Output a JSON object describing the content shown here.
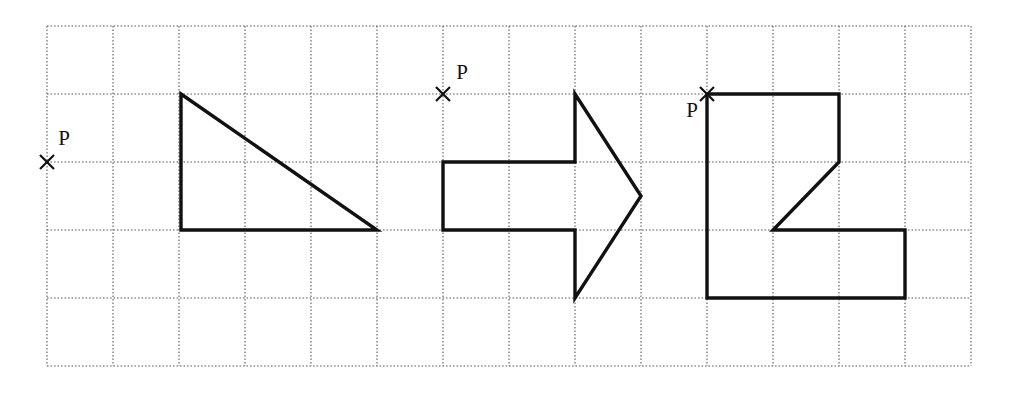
{
  "figure": {
    "canvas": {
      "width": 1013,
      "height": 394
    },
    "grid": {
      "origin_x": 47,
      "origin_y": 26,
      "cell_width": 66,
      "cell_height": 68,
      "columns": 14,
      "rows": 5,
      "line_color": "#5a5a5a",
      "line_style": "dotted"
    },
    "shape_color": "#111111",
    "shapes": [
      {
        "name": "right-triangle",
        "type": "polygon",
        "closed": true,
        "grid_vertices": [
          [
            2,
            1
          ],
          [
            5,
            2
          ],
          [
            2,
            2
          ]
        ],
        "points": "181,94 377,230 181,230"
      },
      {
        "name": "arrow-pentagon",
        "type": "polygon",
        "closed": true,
        "grid_vertices": [
          [
            8,
            1
          ],
          [
            9,
            2.5
          ],
          [
            8,
            4
          ],
          [
            8,
            3
          ],
          [
            6,
            3
          ],
          [
            6,
            2
          ],
          [
            8,
            2
          ]
        ],
        "points": "575,94 641,196 575,298 575,230 443,230 443,162 575,162"
      },
      {
        "name": "z-block-polygon",
        "type": "polygon",
        "closed": true,
        "grid_vertices": [
          [
            10,
            1
          ],
          [
            12,
            1
          ],
          [
            12,
            2
          ],
          [
            11,
            3
          ],
          [
            13,
            3
          ],
          [
            13,
            4
          ],
          [
            10,
            4
          ]
        ],
        "points": "707,94 839,94 839,162 773,230 905,230 905,298 707,298"
      }
    ],
    "points": [
      {
        "name": "point-p-1",
        "label": "P",
        "mark": "x",
        "x": 47,
        "y": 162,
        "label_x": 64,
        "label_y": 145,
        "label_anchor": "middle"
      },
      {
        "name": "point-p-2",
        "label": "P",
        "mark": "x",
        "x": 443,
        "y": 94,
        "label_x": 462,
        "label_y": 79,
        "label_anchor": "middle"
      },
      {
        "name": "point-p-3",
        "label": "P",
        "mark": "x",
        "x": 707,
        "y": 94,
        "label_x": 692,
        "label_y": 117,
        "label_anchor": "middle"
      }
    ]
  }
}
